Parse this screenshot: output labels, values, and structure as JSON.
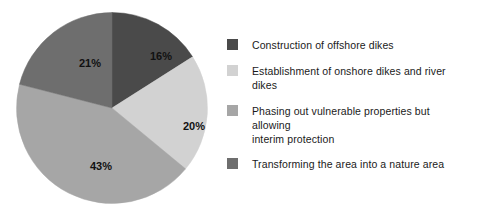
{
  "chart_data": {
    "type": "pie",
    "title": "",
    "subtitle": "",
    "categories": [
      "Construction of offshore dikes",
      "Establishment of onshore dikes and river dikes",
      "Phasing out vulnerable properties but allowing interim protection",
      "Transforming the area into a nature area"
    ],
    "values": [
      16,
      20,
      43,
      21
    ],
    "value_labels": [
      "16%",
      "20%",
      "43%",
      "21%"
    ],
    "colors": [
      "#4a4a4a",
      "#d2d2d2",
      "#a6a6a6",
      "#6e6e6e"
    ],
    "start_angle_deg": 0,
    "direction": "clockwise",
    "legend_position": "right",
    "grid": false,
    "xlabel": "",
    "ylabel": ""
  },
  "pie": {
    "slices": [
      {
        "label": "16%",
        "value": 16,
        "color": "#4a4a4a",
        "label_x": 145,
        "label_y": 48
      },
      {
        "label": "20%",
        "value": 20,
        "color": "#d2d2d2",
        "label_x": 178,
        "label_y": 118
      },
      {
        "label": "43%",
        "value": 43,
        "color": "#a6a6a6",
        "label_x": 85,
        "label_y": 158
      },
      {
        "label": "21%",
        "value": 21,
        "color": "#6e6e6e",
        "label_x": 74,
        "label_y": 55
      }
    ]
  },
  "legend": {
    "items": [
      {
        "label": "Construction of offshore dikes",
        "color": "#4a4a4a",
        "swatch_name": "legend-swatch-offshore-dikes"
      },
      {
        "label": "Establishment of onshore dikes and river dikes",
        "color": "#d2d2d2",
        "swatch_name": "legend-swatch-onshore-river-dikes"
      },
      {
        "label": "Phasing out vulnerable properties but allowing\ninterim protection",
        "color": "#a6a6a6",
        "swatch_name": "legend-swatch-phasing-out-properties"
      },
      {
        "label": "Transforming the area into a nature area",
        "color": "#6e6e6e",
        "swatch_name": "legend-swatch-nature-area"
      }
    ]
  }
}
